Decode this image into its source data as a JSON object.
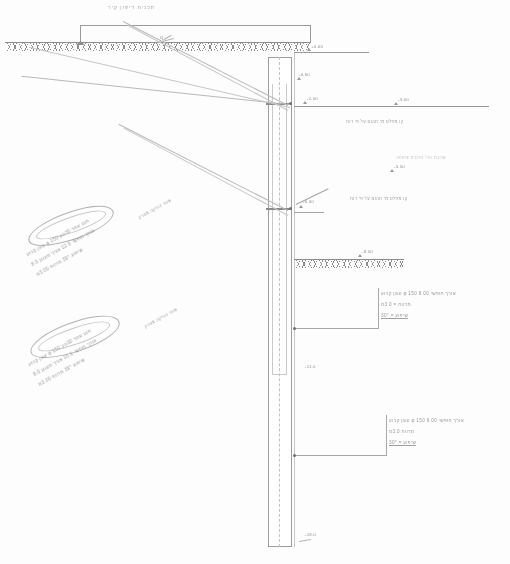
{
  "drawing": {
    "title": "תכנית דיפון  קיר",
    "sheet_label": "חתך אופייני",
    "type": "anchored-diaphragm-wall-section"
  },
  "ground": {
    "top_surface_label": "פני קרקע קיימת",
    "excavation_label": "תחתית חפירה",
    "surcharge_mark": "q"
  },
  "elevations": [
    {
      "id": "top-of-wall",
      "label": "+0.00",
      "x": 310,
      "y": 52
    },
    {
      "id": "wall-cap",
      "label": "-0.60",
      "x": 303,
      "y": 77
    },
    {
      "id": "anchor-row-1",
      "label": "-2.00",
      "x": 307,
      "y": 100
    },
    {
      "id": "water-table-right",
      "label": "-3.00",
      "x": 396,
      "y": 99
    },
    {
      "id": "layer-2-right",
      "label": "-5.50",
      "x": 393,
      "y": 166
    },
    {
      "id": "anchor-row-2",
      "label": "-6.00",
      "x": 303,
      "y": 203
    },
    {
      "id": "excavation-bottom",
      "label": "-8.50",
      "x": 361,
      "y": 257
    },
    {
      "id": "wall-mid",
      "label": "-11.0",
      "x": 305,
      "y": 367
    },
    {
      "id": "wall-toe",
      "label": "-18.0",
      "x": 305,
      "y": 535
    }
  ],
  "notes": {
    "layer_1": "שכבת חול חרסית צפופה",
    "layer_2": "שכבת כורכר מלוכד",
    "right_block_1": [
      "עוגן קבוע φ 150 אורך חופשי 8.00",
      "מרווח  =  3.0מ",
      "שיפוע  =  30°"
    ],
    "right_block_2": [
      "עוגן קבוע φ 150 אורך חופשי 6.00",
      "מרווח 3.0מ",
      "שיפוע  =  30°"
    ],
    "left_block_1": [
      "עוגן קבוע φ 150 מוט אחד  30טון",
      "אורך חופשי 12.0 אורך מעוגן 8.0",
      "שיפוע 30° מרווח 3.00מ"
    ],
    "left_block_2": [
      "עוגן קבוע φ 150 מוט אחד  30טון",
      "אורך חופשי 10.0 אורך מעוגן 8.0",
      "שיפוע 30° מרווח 3.00מ"
    ],
    "bulb_label_1": "אזור הזרקה מוזרק",
    "bulb_label_2": "אזור הזרקה מוזרק",
    "water_note_1": "קו מפלס מי תהום על פי דוח",
    "water_note_2": "קו מפלס מי תהום על פי דוח"
  },
  "wall": {
    "label": "קיר דיפון",
    "toe_label": "תחתית כלונס"
  },
  "colors": {
    "ink": "#8e8e8e",
    "ink_dark": "#6f6f6f",
    "paper": "#fdfdfd"
  }
}
